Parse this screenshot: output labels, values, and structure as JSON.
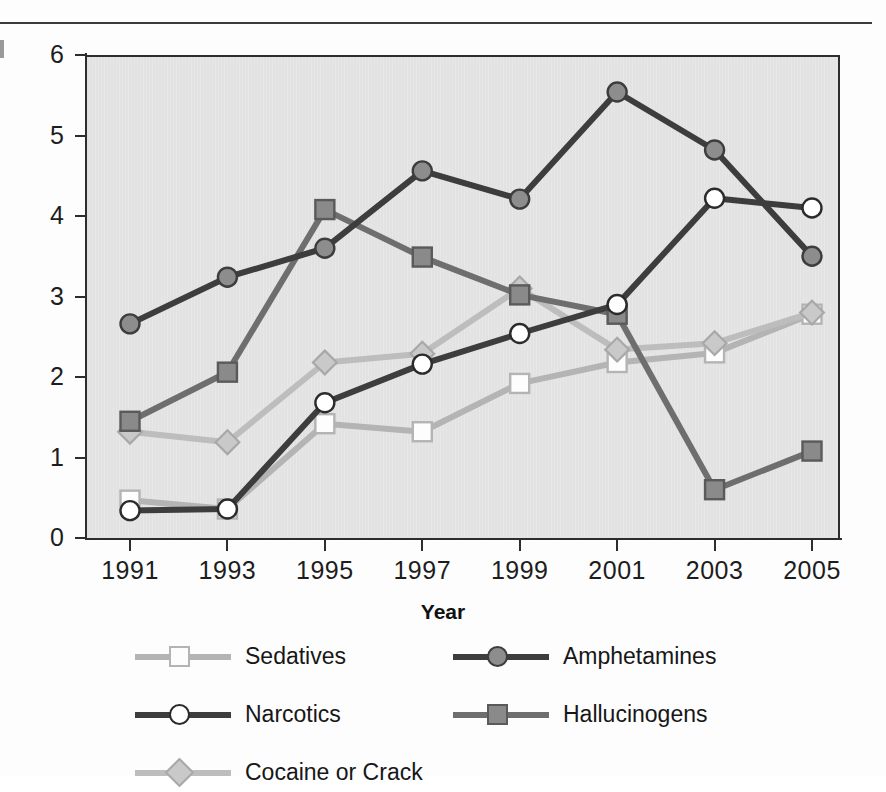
{
  "figure": {
    "xaxis_title": "Year",
    "has_top_rule": true
  },
  "legend": {
    "entries": [
      {
        "label": "Sedatives",
        "key": "sedatives",
        "line_color": "#b4b4b4",
        "marker": "square",
        "marker_fill": "#fdfdfd",
        "marker_stroke": "#b4b4b4",
        "col": 0,
        "row": 0
      },
      {
        "label": "Amphetamines",
        "key": "amphetamines",
        "line_color": "#3d3d3d",
        "marker": "circle",
        "marker_fill": "#8d8d8d",
        "marker_stroke": "#3d3d3d",
        "col": 1,
        "row": 0
      },
      {
        "label": "Narcotics",
        "key": "narcotics",
        "line_color": "#3d3d3d",
        "marker": "circle",
        "marker_fill": "#ffffff",
        "marker_stroke": "#2b2b2b",
        "col": 0,
        "row": 1
      },
      {
        "label": "Hallucinogens",
        "key": "hallucinogens",
        "line_color": "#6e6e6e",
        "marker": "square",
        "marker_fill": "#8a8a8a",
        "marker_stroke": "#5a5a5a",
        "col": 1,
        "row": 1
      },
      {
        "label": "Cocaine or Crack",
        "key": "cocaine",
        "line_color": "#bdbdbd",
        "marker": "diamond",
        "marker_fill": "#c9c9c9",
        "marker_stroke": "#a8a8a8",
        "col": 0,
        "row": 2
      }
    ]
  },
  "chart_data": {
    "type": "line",
    "title": "",
    "xlabel": "Year",
    "ylabel": "",
    "categories": [
      "1991",
      "1993",
      "1995",
      "1997",
      "1999",
      "2001",
      "2003",
      "2005"
    ],
    "x": [
      1991,
      1993,
      1995,
      1997,
      1999,
      2001,
      2003,
      2005
    ],
    "ylim": [
      0,
      6
    ],
    "yticks": [
      0,
      1,
      2,
      3,
      4,
      5,
      6
    ],
    "ytick_labels": [
      "0",
      "1",
      "2",
      "3",
      "4",
      "5",
      "6"
    ],
    "grid": false,
    "legend_position": "bottom",
    "plot_background": "#e2e2e2",
    "series": [
      {
        "name": "Sedatives",
        "key": "sedatives",
        "line_color": "#b4b4b4",
        "marker": "square",
        "marker_fill": "#fdfdfd",
        "marker_stroke": "#b4b4b4",
        "values": [
          0.47,
          0.36,
          1.42,
          1.32,
          1.92,
          2.18,
          2.3,
          2.78
        ]
      },
      {
        "name": "Narcotics",
        "key": "narcotics",
        "line_color": "#3d3d3d",
        "marker": "circle",
        "marker_fill": "#ffffff",
        "marker_stroke": "#2b2b2b",
        "values": [
          0.34,
          0.36,
          1.68,
          2.16,
          2.54,
          2.9,
          4.22,
          4.1
        ]
      },
      {
        "name": "Cocaine or Crack",
        "key": "cocaine",
        "line_color": "#bdbdbd",
        "marker": "diamond",
        "marker_fill": "#c9c9c9",
        "marker_stroke": "#a8a8a8",
        "values": [
          1.32,
          1.19,
          2.18,
          2.29,
          3.1,
          2.34,
          2.42,
          2.8
        ]
      },
      {
        "name": "Amphetamines",
        "key": "amphetamines",
        "line_color": "#3d3d3d",
        "marker": "circle",
        "marker_fill": "#8d8d8d",
        "marker_stroke": "#3d3d3d",
        "values": [
          2.66,
          3.24,
          3.6,
          4.56,
          4.21,
          5.54,
          4.82,
          3.5
        ]
      },
      {
        "name": "Hallucinogens",
        "key": "hallucinogens",
        "line_color": "#6e6e6e",
        "marker": "square",
        "marker_fill": "#8a8a8a",
        "marker_stroke": "#5a5a5a",
        "values": [
          1.45,
          2.06,
          4.08,
          3.49,
          3.02,
          2.78,
          0.6,
          1.08
        ]
      }
    ]
  }
}
